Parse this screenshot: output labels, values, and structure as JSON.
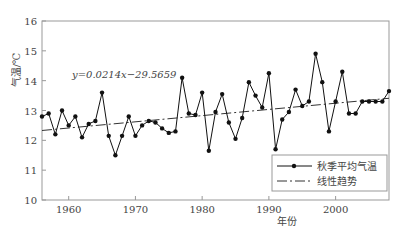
{
  "chart_data": {
    "type": "line",
    "title": "",
    "xlabel": "年份",
    "ylabel": "气温/℃",
    "xlim": [
      1956,
      2008
    ],
    "ylim": [
      10,
      16
    ],
    "xticks": [
      1960,
      1970,
      1980,
      1990,
      2000
    ],
    "yticks": [
      10,
      11,
      12,
      13,
      14,
      15,
      16
    ],
    "annotation": "y=0.0214x−29.5659",
    "legend_position": "lower right",
    "grid": false,
    "x": [
      1956,
      1957,
      1958,
      1959,
      1960,
      1961,
      1962,
      1963,
      1964,
      1965,
      1966,
      1967,
      1968,
      1969,
      1970,
      1971,
      1972,
      1973,
      1974,
      1975,
      1976,
      1977,
      1978,
      1979,
      1980,
      1981,
      1982,
      1983,
      1984,
      1985,
      1986,
      1987,
      1988,
      1989,
      1990,
      1991,
      1992,
      1993,
      1994,
      1995,
      1996,
      1997,
      1998,
      1999,
      2000,
      2001,
      2002,
      2003,
      2004,
      2005,
      2006,
      2007,
      2008
    ],
    "series": [
      {
        "name": "秋季平均气温",
        "style": "line-dot",
        "values": [
          12.8,
          12.9,
          12.2,
          13.0,
          12.5,
          12.8,
          12.1,
          12.55,
          12.65,
          13.6,
          12.15,
          11.5,
          12.15,
          12.8,
          12.15,
          12.5,
          12.65,
          12.6,
          12.4,
          12.25,
          12.3,
          14.1,
          12.9,
          12.85,
          13.6,
          11.65,
          12.95,
          13.55,
          12.6,
          12.05,
          12.75,
          13.95,
          13.5,
          13.1,
          14.25,
          11.7,
          12.7,
          12.95,
          13.7,
          13.15,
          13.3,
          14.9,
          13.95,
          12.3,
          13.3,
          14.3,
          12.9,
          12.9,
          13.3,
          13.3,
          13.3,
          13.3,
          13.65
        ]
      },
      {
        "name": "线性趋势",
        "style": "dash-dot",
        "values_from_equation": "y=0.0214x-29.5659",
        "start": [
          1956,
          12.33
        ],
        "end": [
          2008,
          13.41
        ]
      }
    ]
  },
  "labels": {
    "ylabel": "气温/℃",
    "xlabel": "年份",
    "equation": "y=0.0214x−29.5659",
    "legend_series1": "秋季平均气温",
    "legend_series2": "线性趋势"
  }
}
